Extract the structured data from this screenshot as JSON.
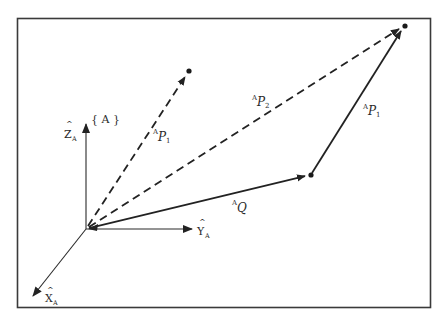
{
  "figure": {
    "type": "vector-diagram",
    "frame_label": "{A}",
    "colors": {
      "ink": "#2a2a2a",
      "border": "#3a3a3a",
      "background": "#ffffff"
    },
    "axes": {
      "origin": [
        86,
        229
      ],
      "z": {
        "label": "Z",
        "hat": "^",
        "subscript": "A",
        "tip": [
          86,
          124
        ]
      },
      "y": {
        "label": "Y",
        "hat": "^",
        "subscript": "A",
        "tip": [
          192,
          230
        ]
      },
      "x": {
        "label": "X",
        "hat": "^",
        "subscript": "A",
        "tip": [
          32,
          297
        ]
      }
    },
    "points": [
      {
        "name": "P1-tip",
        "xy": [
          189,
          71
        ]
      },
      {
        "name": "Q-tip",
        "xy": [
          311,
          175
        ]
      },
      {
        "name": "P2-tip",
        "xy": [
          405,
          26
        ]
      }
    ],
    "vectors": [
      {
        "name": "AP1-from-origin",
        "style": "dashed",
        "from": [
          86,
          229
        ],
        "to": [
          189,
          71
        ],
        "label": {
          "presup": "A",
          "main": "P",
          "sub": "1"
        }
      },
      {
        "name": "AP2",
        "style": "dashed",
        "from": [
          86,
          229
        ],
        "to": [
          405,
          26
        ],
        "label": {
          "presup": "A",
          "main": "P",
          "sub": "2"
        }
      },
      {
        "name": "AQ",
        "style": "solid",
        "from": [
          86,
          229
        ],
        "to": [
          311,
          175
        ],
        "label": {
          "presup": "A",
          "main": "Q",
          "sub": ""
        }
      },
      {
        "name": "AP1-from-Q",
        "style": "solid",
        "from": [
          311,
          175
        ],
        "to": [
          405,
          26
        ],
        "label": {
          "presup": "A",
          "main": "P",
          "sub": "1"
        }
      }
    ]
  },
  "labels": {
    "frame": "{ A }",
    "z_axis": {
      "main": "Z",
      "sub": "A"
    },
    "y_axis": {
      "main": "Y",
      "sub": "A"
    },
    "x_axis": {
      "main": "X",
      "sub": "A"
    },
    "ap1_left": {
      "sup": "A",
      "main": "P",
      "sub": "1"
    },
    "ap2": {
      "sup": "A",
      "main": "P",
      "sub": "2"
    },
    "ap1_right": {
      "sup": "A",
      "main": "P",
      "sub": "1"
    },
    "aq": {
      "sup": "A",
      "main": "Q"
    }
  }
}
